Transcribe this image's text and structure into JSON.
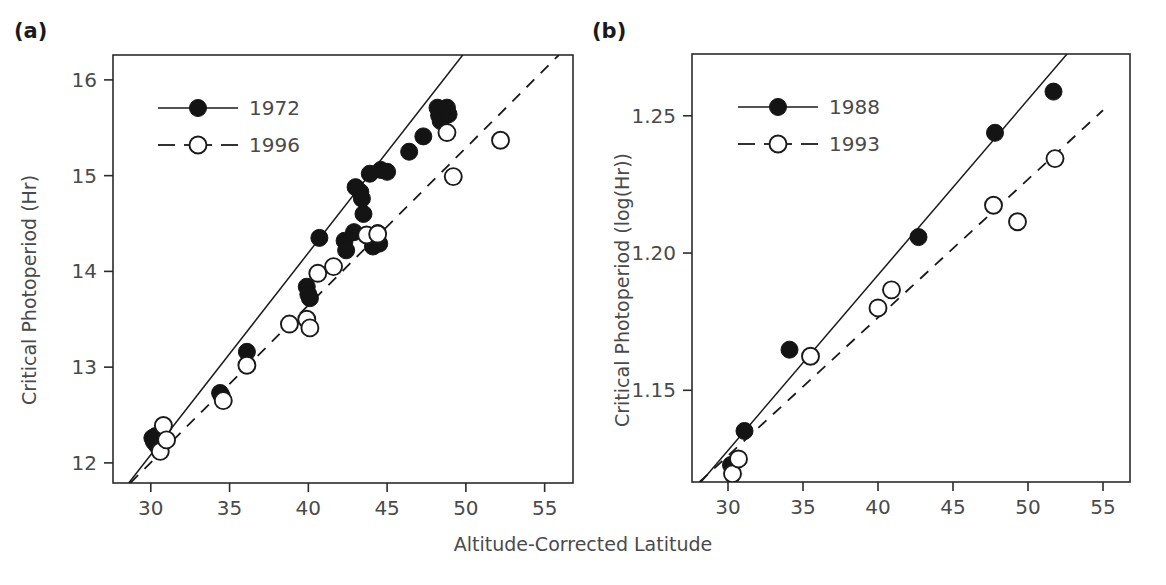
{
  "figure": {
    "xlabel": "Altitude-Corrected Latitude",
    "background": "#ffffff",
    "ink": "#1a1a1a"
  },
  "chart_data": [
    {
      "type": "scatter",
      "panel": "(a)",
      "title": "",
      "xlabel": "Altitude-Corrected Latitude",
      "ylabel": "Critical Photoperiod (Hr)",
      "xlim": [
        27.6,
        56.8
      ],
      "ylim": [
        11.79,
        16.26
      ],
      "xticks": [
        30,
        35,
        40,
        45,
        50,
        55
      ],
      "xticklabels": [
        "30",
        "35",
        "40",
        "45",
        "50",
        "55"
      ],
      "yticks": [
        12,
        13,
        14,
        15,
        16
      ],
      "yticklabels": [
        "12",
        "13",
        "14",
        "15",
        "16"
      ],
      "grid": false,
      "legend_position": "upper left",
      "series": [
        {
          "name": "1972",
          "marker": "filled-circle",
          "linestyle": "solid",
          "points": [
            [
              30.1,
              12.26
            ],
            [
              30.2,
              12.22
            ],
            [
              30.3,
              12.28
            ],
            [
              30.4,
              12.18
            ],
            [
              34.4,
              12.73
            ],
            [
              34.5,
              12.7
            ],
            [
              36.1,
              13.16
            ],
            [
              39.9,
              13.84
            ],
            [
              40.0,
              13.76
            ],
            [
              40.1,
              13.72
            ],
            [
              40.7,
              14.35
            ],
            [
              42.3,
              14.32
            ],
            [
              42.4,
              14.22
            ],
            [
              42.9,
              14.41
            ],
            [
              43.0,
              14.88
            ],
            [
              43.3,
              14.83
            ],
            [
              43.4,
              14.76
            ],
            [
              43.5,
              14.6
            ],
            [
              43.9,
              15.02
            ],
            [
              44.0,
              14.36
            ],
            [
              44.1,
              14.26
            ],
            [
              44.4,
              14.4
            ],
            [
              44.5,
              14.29
            ],
            [
              44.6,
              15.06
            ],
            [
              45.0,
              15.04
            ],
            [
              46.4,
              15.25
            ],
            [
              47.3,
              15.41
            ],
            [
              48.2,
              15.71
            ],
            [
              48.3,
              15.63
            ],
            [
              48.4,
              15.57
            ],
            [
              48.8,
              15.71
            ],
            [
              48.9,
              15.64
            ]
          ],
          "fit_line": {
            "x1": 28.6,
            "y1": 11.79,
            "x2": 49.8,
            "y2": 16.26
          }
        },
        {
          "name": "1996",
          "marker": "open-circle",
          "linestyle": "dashed",
          "points": [
            [
              30.6,
              12.12
            ],
            [
              30.8,
              12.39
            ],
            [
              31.0,
              12.24
            ],
            [
              34.6,
              12.65
            ],
            [
              36.1,
              13.02
            ],
            [
              38.8,
              13.45
            ],
            [
              39.9,
              13.5
            ],
            [
              40.1,
              13.41
            ],
            [
              40.6,
              13.98
            ],
            [
              41.6,
              14.05
            ],
            [
              43.7,
              14.38
            ],
            [
              44.4,
              14.39
            ],
            [
              48.8,
              15.45
            ],
            [
              49.2,
              14.99
            ],
            [
              52.2,
              15.37
            ]
          ],
          "fit_line": {
            "x1": 28.7,
            "y1": 11.79,
            "x2": 55.9,
            "y2": 16.26
          }
        }
      ]
    },
    {
      "type": "scatter",
      "panel": "(b)",
      "title": "",
      "xlabel": "Altitude-Corrected Latitude",
      "ylabel": "Critical Photoperiod (log(Hr))",
      "xlim": [
        27.6,
        56.8
      ],
      "ylim": [
        1.1166,
        1.2725
      ],
      "xticks": [
        30,
        35,
        40,
        45,
        50,
        55
      ],
      "xticklabels": [
        "30",
        "35",
        "40",
        "45",
        "50",
        "55"
      ],
      "yticks": [
        1.15,
        1.2,
        1.25
      ],
      "yticklabels": [
        "1.15",
        "1.20",
        "1.25"
      ],
      "grid": false,
      "legend_position": "upper left",
      "series": [
        {
          "name": "1988",
          "marker": "filled-circle",
          "linestyle": "solid",
          "points": [
            [
              30.2,
              1.1228
            ],
            [
              31.1,
              1.1352
            ],
            [
              34.1,
              1.1648
            ],
            [
              42.7,
              1.2058
            ],
            [
              47.8,
              1.2438
            ],
            [
              51.7,
              1.2588
            ]
          ],
          "fit_line": {
            "x1": 28.2,
            "y1": 1.1166,
            "x2": 52.6,
            "y2": 1.2725
          }
        },
        {
          "name": "1993",
          "marker": "open-circle",
          "linestyle": "dashed",
          "points": [
            [
              30.3,
              1.1196
            ],
            [
              30.7,
              1.125
            ],
            [
              35.5,
              1.1624
            ],
            [
              40.0,
              1.18
            ],
            [
              40.9,
              1.1866
            ],
            [
              47.7,
              1.2174
            ],
            [
              49.3,
              1.2114
            ],
            [
              51.8,
              1.2344
            ]
          ],
          "fit_line": {
            "x1": 28.1,
            "y1": 1.1166,
            "x2": 55.0,
            "y2": 1.252
          }
        }
      ]
    }
  ],
  "panels": [
    {
      "letter": "(a)",
      "ylabel": "Critical Photoperiod (Hr)",
      "legend": [
        {
          "label": "1972",
          "marker": "filled-circle",
          "linestyle": "solid"
        },
        {
          "label": "1996",
          "marker": "open-circle",
          "linestyle": "dashed"
        }
      ]
    },
    {
      "letter": "(b)",
      "ylabel": "Critical Photoperiod (log(Hr))",
      "legend": [
        {
          "label": "1988",
          "marker": "filled-circle",
          "linestyle": "solid"
        },
        {
          "label": "1993",
          "marker": "open-circle",
          "linestyle": "dashed"
        }
      ]
    }
  ]
}
